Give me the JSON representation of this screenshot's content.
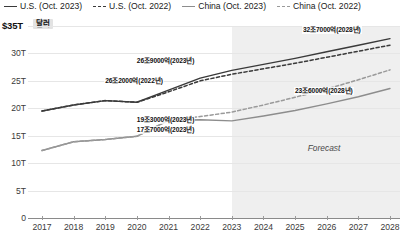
{
  "legend": {
    "items": [
      {
        "label": "U.S. (Oct. 2023)",
        "style": "solid",
        "color": "#3a3a3a",
        "icon": "line-solid-icon"
      },
      {
        "label": "U.S. (Oct. 2022)",
        "style": "dashed",
        "color": "#3a3a3a",
        "icon": "line-dashed-icon"
      },
      {
        "label": "China (Oct. 2023)",
        "style": "solid",
        "color": "#8d8d8d",
        "icon": "line-solid-icon"
      },
      {
        "label": "China (Oct. 2022)",
        "style": "dashed",
        "color": "#9a9a9a",
        "icon": "line-dashed-icon"
      }
    ]
  },
  "axis": {
    "y_top_label": "$35T",
    "unit_badge": "달러"
  },
  "forecast_label": "Forecast",
  "chart_data": {
    "type": "line",
    "title": "",
    "xlabel": "",
    "ylabel": "$35T",
    "unit": "달러",
    "x": [
      2017,
      2018,
      2019,
      2020,
      2021,
      2022,
      2023,
      2024,
      2025,
      2026,
      2027,
      2028
    ],
    "ylim": [
      0,
      35
    ],
    "yticks": [
      "0",
      "5T",
      "10T",
      "15T",
      "20T",
      "25T",
      "30T",
      "$35T"
    ],
    "ytick_values": [
      0,
      5,
      10,
      15,
      20,
      25,
      30,
      35
    ],
    "xticks": [
      "2017",
      "2018",
      "2019",
      "2020",
      "2021",
      "2022",
      "2023",
      "2024",
      "2025",
      "2026",
      "2027",
      "2028"
    ],
    "grid": true,
    "legend_position": "top",
    "forecast_start_x": 2023,
    "series": [
      {
        "name": "U.S. (Oct. 2023)",
        "style": "solid",
        "color": "#3a3a3a",
        "values": [
          19.5,
          20.6,
          21.4,
          21.1,
          23.3,
          25.5,
          26.9,
          28.0,
          29.1,
          30.3,
          31.5,
          32.7
        ]
      },
      {
        "name": "U.S. (Oct. 2022)",
        "style": "dashed",
        "color": "#3a3a3a",
        "values": [
          19.5,
          20.6,
          21.4,
          21.1,
          23.0,
          25.0,
          26.2,
          27.2,
          28.2,
          29.3,
          30.4,
          31.5
        ]
      },
      {
        "name": "China (Oct. 2023)",
        "style": "solid",
        "color": "#8d8d8d",
        "values": [
          12.3,
          13.9,
          14.3,
          14.9,
          17.8,
          17.9,
          17.7,
          18.6,
          19.6,
          20.8,
          22.1,
          23.6
        ]
      },
      {
        "name": "China (Oct. 2022)",
        "style": "dashed",
        "color": "#9a9a9a",
        "values": [
          12.3,
          13.9,
          14.3,
          14.9,
          17.8,
          18.5,
          19.3,
          20.6,
          22.0,
          23.5,
          25.2,
          27.0
        ]
      }
    ],
    "annotations": [
      {
        "text": "26조9000억(2023년)",
        "x": 2023,
        "value": 26.9,
        "series": "U.S. (Oct. 2023)"
      },
      {
        "text": "32조7000억(2028년)",
        "x": 2028,
        "value": 32.7,
        "series": "U.S. (Oct. 2023)"
      },
      {
        "text": "26조2000억(2022년)",
        "x": 2022,
        "value": 26.2,
        "series": "U.S. (Oct. 2022)"
      },
      {
        "text": "19조3000억(2023년)",
        "x": 2023,
        "value": 19.3,
        "series": "China (Oct. 2022)"
      },
      {
        "text": "17조7000억(2023년)",
        "x": 2023,
        "value": 17.7,
        "series": "China (Oct. 2023)"
      },
      {
        "text": "23조6000억(2028년)",
        "x": 2028,
        "value": 23.6,
        "series": "China (Oct. 2023)"
      }
    ]
  }
}
